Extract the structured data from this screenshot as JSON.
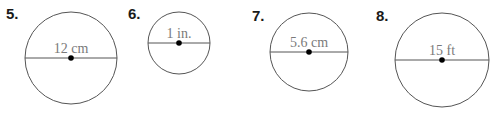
{
  "problems": [
    {
      "number": "5.",
      "diameter_label": "12 cm",
      "cx": 71,
      "cy": 58,
      "r": 46,
      "num_x": 6,
      "num_y": 6
    },
    {
      "number": "6.",
      "diameter_label": "1 in.",
      "cx": 179,
      "cy": 43,
      "r": 31,
      "num_x": 128,
      "num_y": 6
    },
    {
      "number": "7.",
      "diameter_label": "5.6 cm",
      "cx": 309,
      "cy": 52,
      "r": 39,
      "num_x": 252,
      "num_y": 8
    },
    {
      "number": "8.",
      "diameter_label": "15 ft",
      "cx": 442,
      "cy": 60,
      "r": 47,
      "num_x": 376,
      "num_y": 8
    }
  ],
  "colors": {
    "stroke": "#555555",
    "label": "#7a7a7a",
    "dot": "#000000",
    "number": "#1a1a1a"
  }
}
